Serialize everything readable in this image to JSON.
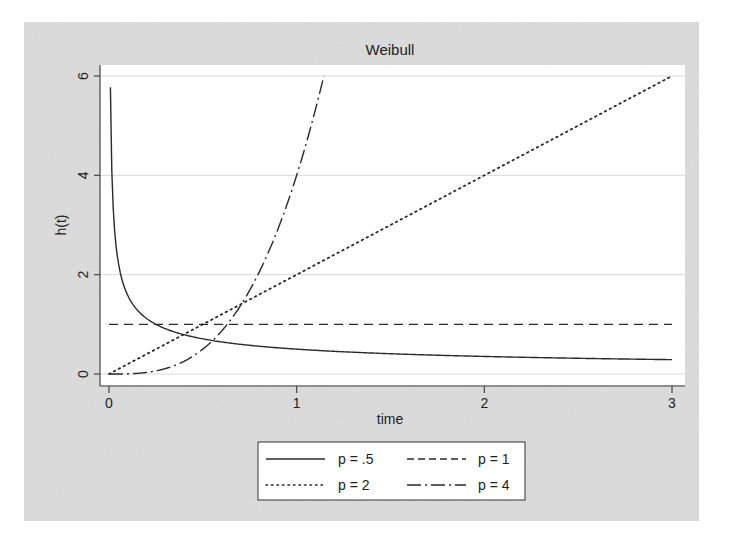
{
  "chart_data": {
    "type": "line",
    "title": "Weibull",
    "xlabel": "time",
    "ylabel": "h(t)",
    "xlim": [
      0,
      3
    ],
    "ylim": [
      0,
      6
    ],
    "xticks": [
      0,
      1,
      2,
      3
    ],
    "yticks": [
      0,
      2,
      4,
      6
    ],
    "xtick_labels": [
      "0",
      "1",
      "2",
      "3"
    ],
    "ytick_labels": [
      "0",
      "2",
      "4",
      "6"
    ],
    "grid": "horizontal",
    "legend_position": "bottom",
    "function": "h(t) = p * t^(p-1)",
    "series": [
      {
        "name": "p = .5",
        "p": 0.5,
        "style": "solid",
        "x": [
          0.01,
          0.02,
          0.05,
          0.1,
          0.2,
          0.5,
          1,
          1.5,
          2,
          2.5,
          3
        ],
        "y": [
          5.0,
          3.54,
          2.24,
          1.58,
          1.12,
          0.71,
          0.5,
          0.41,
          0.35,
          0.32,
          0.29
        ]
      },
      {
        "name": "p = 1",
        "p": 1,
        "style": "dashed",
        "x": [
          0,
          3
        ],
        "y": [
          1,
          1
        ]
      },
      {
        "name": "p = 2",
        "p": 2,
        "style": "dotted",
        "x": [
          0,
          1,
          2,
          3
        ],
        "y": [
          0,
          2,
          4,
          6
        ]
      },
      {
        "name": "p = 4",
        "p": 4,
        "style": "dash-dot",
        "x": [
          0,
          0.25,
          0.5,
          0.75,
          1,
          1.1,
          1.145
        ],
        "y": [
          0,
          0.06,
          0.5,
          1.69,
          4,
          5.32,
          6.0
        ]
      }
    ],
    "legend": [
      "p = .5",
      "p = 1",
      "p = 2",
      "p = 4"
    ]
  },
  "colors": {
    "panel_background": "#dcdcdc",
    "plot_background": "#ffffff",
    "gridline": "#d8d8d8",
    "line": "#2a2a2a"
  }
}
